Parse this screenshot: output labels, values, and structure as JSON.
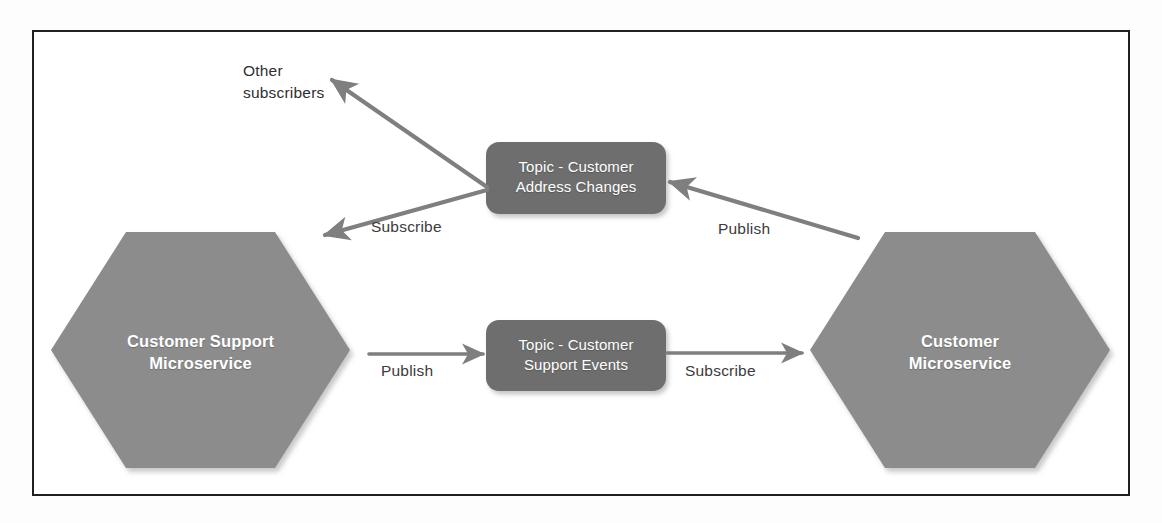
{
  "diagram": {
    "type": "publish-subscribe-architecture",
    "frame": {
      "border_color": "#231f20",
      "background": "#ffffff"
    },
    "colors": {
      "service_fill": "#8c8c8c",
      "topic_fill": "#6e6e6e",
      "connector": "#7f7f7f",
      "node_text": "#ffffff",
      "label_text": "#2f2f2f",
      "border": "#231f20"
    },
    "nodes": [
      {
        "id": "customer-support-microservice",
        "shape": "hexagon",
        "fill": "#8c8c8c",
        "label_lines": [
          "Customer Support",
          "Microservice"
        ],
        "label": "Customer Support Microservice"
      },
      {
        "id": "customer-microservice",
        "shape": "hexagon",
        "fill": "#8c8c8c",
        "label_lines": [
          "Customer",
          "Microservice"
        ],
        "label": "Customer Microservice"
      },
      {
        "id": "topic-customer-address-changes",
        "shape": "rounded-rectangle",
        "fill": "#6e6e6e",
        "label_lines": [
          "Topic - Customer",
          "Address Changes"
        ],
        "label": "Topic - Customer Address Changes"
      },
      {
        "id": "topic-customer-support-events",
        "shape": "rounded-rectangle",
        "fill": "#6e6e6e",
        "label_lines": [
          "Topic - Customer",
          "Support Events"
        ],
        "label": "Topic - Customer Support Events"
      }
    ],
    "free_text": [
      {
        "id": "other-subscribers",
        "lines": [
          "Other",
          "subscribers"
        ],
        "text": "Other subscribers"
      }
    ],
    "edges": [
      {
        "id": "edge-address-topic-to-other-subscribers",
        "from": "topic-customer-address-changes",
        "to": "other-subscribers",
        "label": "",
        "arrowhead": "end"
      },
      {
        "id": "edge-address-topic-to-support-service",
        "from": "topic-customer-address-changes",
        "to": "customer-support-microservice",
        "label": "Subscribe",
        "arrowhead": "end"
      },
      {
        "id": "edge-customer-service-to-address-topic",
        "from": "customer-microservice",
        "to": "topic-customer-address-changes",
        "label": "Publish",
        "arrowhead": "end"
      },
      {
        "id": "edge-support-service-to-support-topic",
        "from": "customer-support-microservice",
        "to": "topic-customer-support-events",
        "label": "Publish",
        "arrowhead": "end"
      },
      {
        "id": "edge-support-topic-to-customer-service",
        "from": "topic-customer-support-events",
        "to": "customer-microservice",
        "label": "Subscribe",
        "arrowhead": "end"
      }
    ]
  }
}
